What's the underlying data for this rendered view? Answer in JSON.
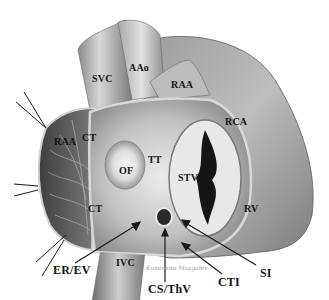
{
  "figure": {
    "palette": {
      "background": "#ffffff",
      "tissue_dark": "#4a4a4a",
      "tissue_mid": "#8c8c8c",
      "tissue_light": "#d6d6d6",
      "highlight": "#f2f2f2",
      "label_text": "#141414",
      "pointer": "#1a1a1a"
    },
    "labels": {
      "svc": "SVC",
      "aao": "AAo",
      "raa_top": "RAA",
      "rca": "RCA",
      "raa_left": "RAA",
      "ct_top": "CT",
      "ct_lower": "CT",
      "of": "OF",
      "tt": "TT",
      "stv": "STV",
      "rv": "RV",
      "ivc": "IVC",
      "er_ev": "ER/EV",
      "cs_thv": "CS/ThV",
      "cti": "CTI",
      "si": "SI"
    },
    "signature": "Kusumoto Mazgalev"
  }
}
